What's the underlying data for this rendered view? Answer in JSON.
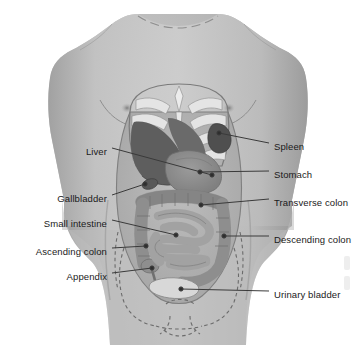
{
  "diagram": {
    "style": "grayscale-medical-illustration",
    "background_color": "#ffffff",
    "leader_line_color": "#3a3a3a",
    "label_text_color": "#1a1a1a",
    "skin_color": "#b9b9b9",
    "skin_shadow_color": "#9a9a9a",
    "rib_color": "#e4e4e4",
    "liver_color": "#5e5e5e",
    "stomach_color": "#8d8d8d",
    "intestine_color": "#a2a2a2",
    "bladder_color": "#d8d8d8",
    "bone_outline_color": "#6b6b6b"
  },
  "labels_left": [
    {
      "id": "liver",
      "text": "Liver",
      "x": 107,
      "y": 151,
      "tip_x": 212,
      "tip_y": 175
    },
    {
      "id": "gallbladder",
      "text": "Gallbladder",
      "x": 107,
      "y": 198,
      "tip_x": 145,
      "tip_y": 184
    },
    {
      "id": "small-intestine",
      "text": "Small intestine",
      "x": 107,
      "y": 223,
      "tip_x": 176,
      "tip_y": 235
    },
    {
      "id": "ascending-colon",
      "text": "Ascending colon",
      "x": 107,
      "y": 251,
      "tip_x": 146,
      "tip_y": 246
    },
    {
      "id": "appendix",
      "text": "Appendix",
      "x": 107,
      "y": 276,
      "tip_x": 152,
      "tip_y": 268
    }
  ],
  "labels_right": [
    {
      "id": "spleen",
      "text": "Spleen",
      "x": 274,
      "y": 146,
      "tip_x": 219,
      "tip_y": 133
    },
    {
      "id": "stomach",
      "text": "Stomach",
      "x": 274,
      "y": 174,
      "tip_x": 200,
      "tip_y": 172
    },
    {
      "id": "transverse-colon",
      "text": "Transverse colon",
      "x": 274,
      "y": 202,
      "tip_x": 201,
      "tip_y": 205
    },
    {
      "id": "descending-colon",
      "text": "Descending colon",
      "x": 274,
      "y": 239,
      "tip_x": 224,
      "tip_y": 236
    },
    {
      "id": "urinary-bladder",
      "text": "Urinary bladder",
      "x": 274,
      "y": 294,
      "tip_x": 181,
      "tip_y": 289
    }
  ]
}
